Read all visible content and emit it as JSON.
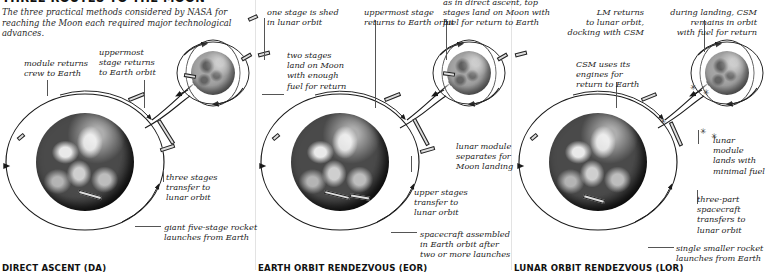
{
  "header": {
    "title": "THREE ROUTES TO THE MOON",
    "subtitle": "The three practical methods considered by NASA for reaching the Moon each required major technological advances."
  },
  "sections": [
    {
      "id": "direct-ascent",
      "caption": "DIRECT ASCENT (DA)"
    },
    {
      "id": "earth-orbit-rendezvous",
      "caption": "EARTH ORBIT RENDEZVOUS (EOR)"
    },
    {
      "id": "lunar-orbit-rendezvous",
      "caption": "LUNAR ORBIT RENDEZVOUS (LOR)"
    }
  ],
  "labels": {
    "da": {
      "module_returns": "module returns\ncrew to Earth",
      "uppermost_stage": "uppermost\nstage returns\nto Earth orbit",
      "one_stage_shed": "one stage is shed\nin lunar orbit",
      "two_stages_land": "two stages\nland on Moon\nwith enough\nfuel for return",
      "three_stages": "three stages\ntransfer to\nlunar orbit",
      "giant_rocket": "giant five-stage rocket\nlaunches from Earth"
    },
    "eor": {
      "uppermost_stage": "uppermost stage\nreturns to Earth orbit",
      "top_stages_land": "as in direct ascent, top\nstages land on Moon with\nfuel for return to Earth",
      "lunar_module_separates": "lunar module\nseparates for\nMoon landing",
      "upper_stages": "upper stages\ntransfer to\nlunar orbit",
      "spacecraft_assembled": "spacecraft assembled\nin Earth orbit after\ntwo or more launches"
    },
    "lor": {
      "lm_returns": "LM returns\nto lunar orbit,\ndocking with CSM",
      "csm_remains": "during landing, CSM\nremains in orbit\nwith fuel for return",
      "csm_engines": "CSM uses its\nengines for\nreturn to Earth",
      "lunar_module_lands": "lunar module\nlands with\nminimal fuel",
      "three_part": "three-part\nspacecraft\ntransfers to\nlunar orbit",
      "single_rocket": "single smaller rocket\nlaunches from Earth"
    }
  },
  "colors": {
    "ink": "#1a1a1a",
    "background": "#ffffff",
    "leader": "#555555",
    "divider": "#e3e3e3"
  },
  "bodies": [
    {
      "name": "earth-da",
      "kind": "earth",
      "x": 36,
      "y": 113,
      "d": 98
    },
    {
      "name": "moon-da",
      "kind": "moon",
      "x": 191,
      "y": 51,
      "d": 44
    },
    {
      "name": "earth-eor",
      "kind": "earth",
      "x": 290,
      "y": 113,
      "d": 98
    },
    {
      "name": "moon-eor",
      "kind": "moon",
      "x": 447,
      "y": 51,
      "d": 44
    },
    {
      "name": "earth-lor",
      "kind": "earth",
      "x": 548,
      "y": 113,
      "d": 98
    },
    {
      "name": "moon-lor",
      "kind": "moon",
      "x": 705,
      "y": 51,
      "d": 44
    }
  ]
}
